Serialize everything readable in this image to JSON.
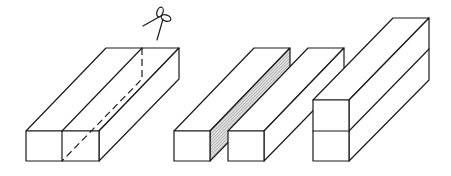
{
  "figure": {
    "description": "Cutting a rectangular block lengthwise into two bars and stacking them",
    "stroke_color": "#1a1a1a",
    "hatch_color": "#bdbdbd",
    "background": "#ffffff"
  },
  "steps": [
    {
      "id": "original-block",
      "label": "Original block with cut line",
      "icon": "scissors-icon"
    },
    {
      "id": "cut-bars",
      "label": "Block cut into two bars (cut face shaded)"
    },
    {
      "id": "stacked-bars",
      "label": "Two bars stacked vertically"
    }
  ]
}
